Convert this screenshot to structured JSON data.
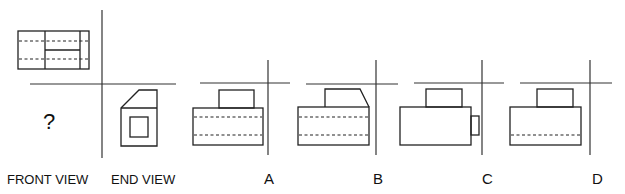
{
  "labels": {
    "front_view": "FRONT VIEW",
    "end_view": "END VIEW",
    "question_mark": "?"
  },
  "options": [
    {
      "letter": "A",
      "description": "top block rectangle on main body with two hidden (dashed) lines"
    },
    {
      "letter": "B",
      "description": "top block with chamfered right corner on main body with two hidden (dashed) lines"
    },
    {
      "letter": "C",
      "description": "top block on main body with small projection on right, no hidden lines"
    },
    {
      "letter": "D",
      "description": "top block on main body with one hidden (dashed) line"
    }
  ],
  "views": {
    "top_view": "plan view rectangle with two vertical lines, one partial horizontal solid line and two dashed hidden lines",
    "end_view": "profile with chamfered upper-left corner and inner square"
  },
  "colors": {
    "line": "#222222",
    "background": "#ffffff"
  }
}
